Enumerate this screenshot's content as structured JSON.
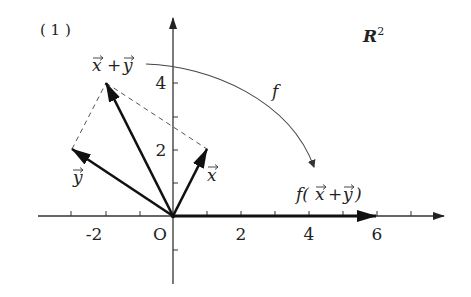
{
  "figure": {
    "panel_label": "(1)",
    "space_label": "R",
    "space_superscript": "2",
    "map_label": "f",
    "colors": {
      "axis": "#333333",
      "vector": "#111111",
      "dashed": "#555555",
      "arc": "#444444",
      "text": "#222222"
    }
  },
  "axes": {
    "origin_label": "O",
    "x_ticks": [
      -3,
      -2,
      -1,
      1,
      2,
      3,
      4,
      5,
      6,
      7
    ],
    "x_tick_labels": [
      "-2",
      "2",
      "4",
      "6"
    ],
    "y_ticks": [
      -1,
      1,
      2,
      3,
      4
    ],
    "y_tick_labels": [
      "2",
      "4"
    ]
  },
  "vectors": [
    {
      "name": "x",
      "label": "x⃗",
      "tip": [
        1,
        2
      ]
    },
    {
      "name": "y",
      "label": "y⃗",
      "tip": [
        -3,
        2
      ]
    },
    {
      "name": "x_plus_y",
      "label": "x⃗+y⃗",
      "tip": [
        -2,
        4
      ]
    },
    {
      "name": "f_x_plus_y",
      "label": "f(x⃗+y⃗)",
      "tip": [
        6,
        0
      ]
    }
  ],
  "labels": {
    "x_vec": "x",
    "y_vec": "y",
    "sum": "+",
    "f_open": "f(",
    "f_close": ")"
  }
}
